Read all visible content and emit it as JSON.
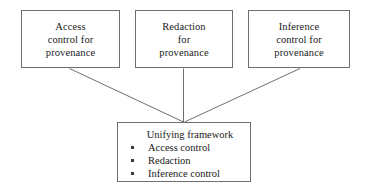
{
  "diagram": {
    "background_color": "#ffffff",
    "line_color": "#6e6e6e",
    "text_color": "#1a1a1a",
    "nodes": {
      "access": {
        "lines": [
          "Access",
          "control for",
          "provenance"
        ]
      },
      "redaction": {
        "lines": [
          "Redaction",
          "for",
          "provenance"
        ]
      },
      "inference": {
        "lines": [
          "Inference",
          "control for",
          "provenance"
        ]
      },
      "unifying": {
        "title": "Unifying framework",
        "bullets": [
          "Access control",
          "Redaction",
          "Inference control"
        ]
      }
    },
    "connectors": [
      {
        "name": "access-to-unifying",
        "from": "access",
        "to": "unifying",
        "shape": "diagonal"
      },
      {
        "name": "redaction-to-unifying",
        "from": "redaction",
        "to": "unifying",
        "shape": "vertical"
      },
      {
        "name": "inference-to-unifying",
        "from": "inference",
        "to": "unifying",
        "shape": "diagonal"
      }
    ]
  }
}
